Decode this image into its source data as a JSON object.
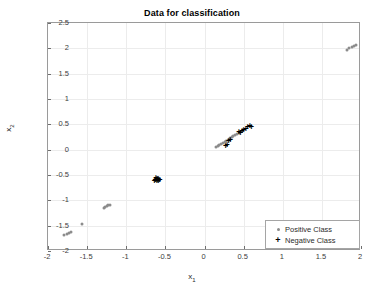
{
  "chart_data": {
    "type": "scatter",
    "title": "Data for classification",
    "xlabel": "x_1",
    "ylabel": "x_2",
    "xlabel_base": "x",
    "xlabel_sub": "1",
    "ylabel_base": "x",
    "ylabel_sub": "2",
    "xlim": [
      -2,
      2
    ],
    "ylim": [
      -2,
      2.5
    ],
    "grid": true,
    "legend_position": "lower right",
    "xticks": [
      -2,
      -1.5,
      -1,
      -0.5,
      0,
      0.5,
      1,
      1.5,
      2
    ],
    "xticklabels": [
      "-2",
      "-1.5",
      "-1",
      "-0.5",
      "0",
      "0.5",
      "1",
      "1.5",
      "2"
    ],
    "yticks": [
      -2,
      -1.5,
      -1,
      -0.5,
      0,
      0.5,
      1,
      1.5,
      2,
      2.5
    ],
    "yticklabels": [
      "-2",
      "-1.5",
      "-1",
      "-0.5",
      "0",
      "0.5",
      "1",
      "1.5",
      "2",
      "2.5"
    ],
    "series": [
      {
        "name": "Positive Class",
        "marker": "dot",
        "color": "#8c8c8c",
        "points": [
          [
            -1.79,
            -1.68
          ],
          [
            -1.76,
            -1.66
          ],
          [
            -1.73,
            -1.64
          ],
          [
            -1.7,
            -1.62
          ],
          [
            -1.57,
            -1.46
          ],
          [
            -1.29,
            -1.15
          ],
          [
            -1.27,
            -1.14
          ],
          [
            -1.25,
            -1.12
          ],
          [
            -1.23,
            -1.1
          ],
          [
            -1.21,
            -1.09
          ],
          [
            0.15,
            0.05
          ],
          [
            0.17,
            0.07
          ],
          [
            0.19,
            0.09
          ],
          [
            0.21,
            0.11
          ],
          [
            0.24,
            0.14
          ],
          [
            0.26,
            0.16
          ],
          [
            0.28,
            0.18
          ],
          [
            0.3,
            0.2
          ],
          [
            0.33,
            0.23
          ],
          [
            0.35,
            0.25
          ],
          [
            0.37,
            0.27
          ],
          [
            0.39,
            0.28
          ],
          [
            0.42,
            0.31
          ],
          [
            0.44,
            0.33
          ],
          [
            0.46,
            0.35
          ],
          [
            0.48,
            0.37
          ],
          [
            1.82,
            1.97
          ],
          [
            1.85,
            2.0
          ],
          [
            1.88,
            2.02
          ],
          [
            1.91,
            2.04
          ],
          [
            1.94,
            2.06
          ]
        ]
      },
      {
        "name": "Negative Class",
        "marker": "plus",
        "color": "#000000",
        "points": [
          [
            -0.64,
            -0.63
          ],
          [
            -0.63,
            -0.61
          ],
          [
            -0.62,
            -0.6
          ],
          [
            -0.61,
            -0.62
          ],
          [
            -0.6,
            -0.59
          ],
          [
            -0.6,
            -0.61
          ],
          [
            -0.59,
            -0.58
          ],
          [
            -0.58,
            -0.6
          ],
          [
            -0.62,
            -0.57
          ],
          [
            -0.59,
            -0.63
          ],
          [
            -0.57,
            -0.61
          ],
          [
            -0.61,
            -0.58
          ],
          [
            0.27,
            0.06
          ],
          [
            0.29,
            0.09
          ],
          [
            0.31,
            0.16
          ],
          [
            0.33,
            0.18
          ],
          [
            0.44,
            0.34
          ],
          [
            0.46,
            0.32
          ],
          [
            0.48,
            0.36
          ],
          [
            0.5,
            0.38
          ],
          [
            0.53,
            0.4
          ],
          [
            0.55,
            0.43
          ],
          [
            0.58,
            0.45
          ],
          [
            0.6,
            0.44
          ]
        ]
      }
    ]
  },
  "legend": {
    "items": [
      {
        "label": "Positive Class",
        "marker": "dot-marker"
      },
      {
        "label": "Negative Class",
        "marker": "plus-marker"
      }
    ]
  }
}
